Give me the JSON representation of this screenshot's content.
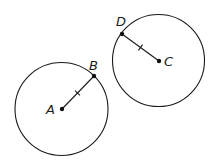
{
  "diagram": {
    "type": "geometry",
    "colors": {
      "stroke": "#1a1a1a",
      "point": "#111111",
      "background": "#ffffff"
    },
    "circles": [
      {
        "id": "circle-A",
        "center": "A",
        "cx": 61.5,
        "cy": 109,
        "r": 46.5
      },
      {
        "id": "circle-C",
        "center": "C",
        "cx": 158.5,
        "cy": 60.5,
        "r": 46
      }
    ],
    "points": [
      {
        "name": "A",
        "x": 62,
        "y": 109,
        "label": "A",
        "lx": 46,
        "ly": 114
      },
      {
        "name": "B",
        "x": 94,
        "y": 76,
        "label": "B",
        "lx": 89,
        "ly": 70
      },
      {
        "name": "C",
        "x": 159,
        "y": 61,
        "label": "C",
        "lx": 164,
        "ly": 66
      },
      {
        "name": "D",
        "x": 122,
        "y": 34,
        "label": "D",
        "lx": 116,
        "ly": 26
      }
    ],
    "segments": [
      {
        "from": "A",
        "to": "B",
        "ticks": 1,
        "tick_x": 77.5,
        "tick_y": 93
      },
      {
        "from": "D",
        "to": "C",
        "ticks": 1,
        "tick_x": 140.5,
        "tick_y": 47.5
      }
    ]
  }
}
